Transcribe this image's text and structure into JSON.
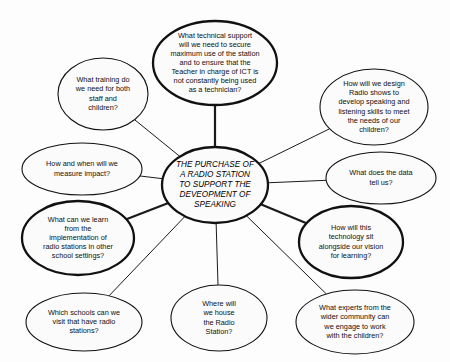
{
  "diagram": {
    "type": "mind-map",
    "title_node": {
      "id": "center",
      "lines": [
        "THE PURCHASE OF",
        "A RADIO STATION",
        "TO SUPPORT THE",
        "DEVEOPMENT OF",
        "SPEAKING"
      ],
      "text": "THE PURCHASE OF A RADIO STATION TO SUPPORT THE DEVEOPMENT OF SPEAKING",
      "style": "italic",
      "emphasis": "thick",
      "cx": 215,
      "cy": 185,
      "rx": 53,
      "ry": 38
    },
    "nodes": [
      {
        "id": "technical-support",
        "lines": [
          "What technical support",
          "will we need to secure",
          "maximum use of the station",
          "and to ensure that the",
          "Teacher in charge of ICT is",
          "not constantly being used",
          "as a technician?"
        ],
        "text": "What technical support will we need to secure maximum use of the station and to ensure that the Teacher in charge of ICT is not constantly being used as a technician?",
        "emphasis": "thick",
        "cx": 215,
        "cy": 63,
        "rx": 62,
        "ry": 42
      },
      {
        "id": "training",
        "lines": [
          "What training do",
          "we need for both",
          "staff and",
          "children?"
        ],
        "text": "What training do we need for both staff and children?",
        "emphasis": "thin",
        "cx": 103,
        "cy": 94,
        "rx": 45,
        "ry": 36
      },
      {
        "id": "radio-show-design",
        "lines": [
          "How will we design",
          "Radio shows to",
          "develop speaking and",
          "listening skills to meet",
          "the needs of our",
          "children?"
        ],
        "text": "How will we design Radio shows to develop speaking and listening skills to meet the needs of our children?",
        "emphasis": "thin",
        "cx": 374,
        "cy": 107,
        "rx": 54,
        "ry": 38
      },
      {
        "id": "measure-impact",
        "lines": [
          "How and when will we",
          "measure impact?"
        ],
        "text": "How and when will we measure impact?",
        "emphasis": "thin",
        "cx": 82,
        "cy": 169,
        "rx": 60,
        "ry": 26
      },
      {
        "id": "data-tell-us",
        "lines": [
          "What does the data",
          "tell us?"
        ],
        "text": "What does the data tell us?",
        "emphasis": "thin",
        "cx": 381,
        "cy": 178,
        "rx": 55,
        "ry": 26
      },
      {
        "id": "other-school-settings",
        "lines": [
          "What can we learn",
          "from the",
          "implementation of",
          "radio stations in other",
          "school settings?"
        ],
        "text": "What can we learn from the implementation of radio stations in other school settings?",
        "emphasis": "thick",
        "cx": 78,
        "cy": 238,
        "rx": 56,
        "ry": 37
      },
      {
        "id": "technology-vision",
        "lines": [
          "How will this",
          "technology sit",
          "alongside our vision",
          "for learning?"
        ],
        "text": "How will this technology sit alongside our vision for learning?",
        "emphasis": "thick",
        "cx": 351,
        "cy": 242,
        "rx": 52,
        "ry": 36
      },
      {
        "id": "visit-schools",
        "lines": [
          "Which schools can we",
          "visit that have radio",
          "stations?"
        ],
        "text": "Which schools can we visit that have radio stations?",
        "emphasis": "thin",
        "cx": 84,
        "cy": 322,
        "rx": 58,
        "ry": 29
      },
      {
        "id": "house-station",
        "lines": [
          "Where will",
          "we house",
          "the Radio",
          "Station?"
        ],
        "text": "Where will we house the Radio Station?",
        "emphasis": "thin",
        "cx": 219,
        "cy": 318,
        "rx": 48,
        "ry": 33
      },
      {
        "id": "community-experts",
        "lines": [
          "What experts from the",
          "wider community can",
          "we engage to work",
          "with the children?"
        ],
        "text": "What experts from the wider community can we engage to work with the children?",
        "emphasis": "thin",
        "cx": 355,
        "cy": 322,
        "rx": 59,
        "ry": 32
      }
    ],
    "connections": [
      {
        "from": "center",
        "to": "technical-support",
        "emphasis": "thick"
      },
      {
        "from": "center",
        "to": "training",
        "emphasis": "thin"
      },
      {
        "from": "center",
        "to": "radio-show-design",
        "emphasis": "thin"
      },
      {
        "from": "center",
        "to": "measure-impact",
        "emphasis": "thin"
      },
      {
        "from": "center",
        "to": "data-tell-us",
        "emphasis": "thin"
      },
      {
        "from": "center",
        "to": "other-school-settings",
        "emphasis": "thick"
      },
      {
        "from": "center",
        "to": "technology-vision",
        "emphasis": "thick"
      },
      {
        "from": "center",
        "to": "visit-schools",
        "emphasis": "thin"
      },
      {
        "from": "center",
        "to": "house-station",
        "emphasis": "thin"
      },
      {
        "from": "center",
        "to": "community-experts",
        "emphasis": "thin"
      }
    ]
  }
}
